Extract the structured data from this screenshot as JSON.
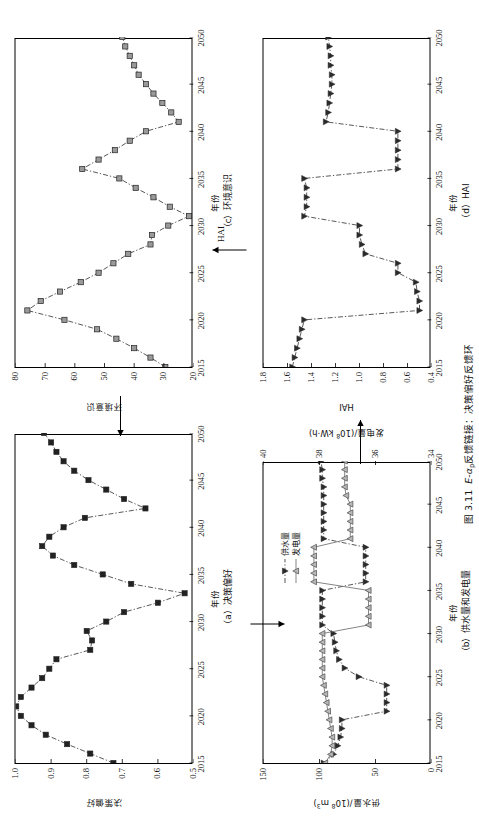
{
  "figure": {
    "caption_number": "图 3.11",
    "caption_text_pre": "E-α",
    "caption_text_sub": "p",
    "caption_text_post": "反馈链接：决策偏好反馈环"
  },
  "arrows": {
    "a_to_b_label": "",
    "b_to_d_label": "",
    "d_to_c_label": "HAI",
    "c_to_a_label": "",
    "supply_label_pre": "供水量/(10",
    "supply_label_sup": "8",
    "supply_label_post": " m",
    "supply_label_sup2": "3",
    "supply_label_end": ")"
  },
  "panels": [
    {
      "id": "a",
      "caption": "（a）决策偏好",
      "xlabel": "年份",
      "ylabel": "决策偏好",
      "xticks": [
        "2015",
        "2020",
        "2025",
        "2030",
        "2035",
        "2040",
        "2045",
        "2050"
      ],
      "yticks": [
        "0.5",
        "0.6",
        "0.7",
        "0.8",
        "0.9",
        "1.0"
      ]
    },
    {
      "id": "b",
      "caption": "（b）供水量和发电量",
      "xlabel": "年份",
      "ylabel_left_pre": "供水量/(10",
      "ylabel_left_sup": "8",
      "ylabel_left_mid": " m",
      "ylabel_left_sup2": "3",
      "ylabel_left_end": ")",
      "ylabel_right_pre": "发电量/(10",
      "ylabel_right_sup": "8",
      "ylabel_right_end": " kW·h)",
      "xticks": [
        "2015",
        "2020",
        "2025",
        "2030",
        "2035",
        "2040",
        "2045",
        "2050"
      ],
      "yticks_left": [
        "0",
        "50",
        "100",
        "150"
      ],
      "yticks_right": [
        "34",
        "36",
        "38",
        "40"
      ],
      "legend": [
        "供水量",
        "发电量"
      ]
    },
    {
      "id": "c",
      "caption": "（c）环境意识",
      "xlabel": "年份",
      "ylabel": "环境意识",
      "xticks": [
        "2015",
        "2020",
        "2025",
        "2030",
        "2035",
        "2040",
        "2045",
        "2050"
      ],
      "yticks": [
        "20",
        "30",
        "40",
        "50",
        "60",
        "70",
        "80"
      ]
    },
    {
      "id": "d",
      "caption": "（d）HAI",
      "xlabel": "年份",
      "ylabel": "HAI",
      "xticks": [
        "2015",
        "2020",
        "2025",
        "2030",
        "2035",
        "2040",
        "2045",
        "2050"
      ],
      "yticks": [
        "0.4",
        "0.6",
        "0.8",
        "1.0",
        "1.2",
        "1.4",
        "1.6",
        "1.8"
      ]
    }
  ],
  "chart_data": [
    {
      "type": "line",
      "panel": "a",
      "title": "（a）决策偏好",
      "xlabel": "年份",
      "ylabel": "决策偏好",
      "xlim": [
        2015,
        2050
      ],
      "ylim": [
        0.5,
        1.0
      ],
      "grid": false,
      "marker": "square-filled",
      "linestyle": "dash-dot",
      "x": [
        2015,
        2016,
        2017,
        2018,
        2019,
        2020,
        2021,
        2022,
        2023,
        2024,
        2025,
        2026,
        2027,
        2028,
        2029,
        2030,
        2031,
        2032,
        2033,
        2034,
        2035,
        2036,
        2037,
        2038,
        2039,
        2040,
        2041,
        2042,
        2043,
        2044,
        2045,
        2046,
        2047,
        2048,
        2049,
        2050
      ],
      "values": [
        0.725,
        0.79,
        0.855,
        0.915,
        0.955,
        0.985,
        0.998,
        0.985,
        0.955,
        0.925,
        0.905,
        0.885,
        0.79,
        0.785,
        0.8,
        0.745,
        0.695,
        0.6,
        0.525,
        0.675,
        0.755,
        0.835,
        0.895,
        0.925,
        0.905,
        0.865,
        0.805,
        0.635,
        0.695,
        0.745,
        0.795,
        0.835,
        0.865,
        0.885,
        0.9,
        0.92
      ]
    },
    {
      "type": "line",
      "panel": "b",
      "title": "（b）供水量和发电量",
      "xlabel": "年份",
      "ylabel_left": "供水量/(10^8 m^3)",
      "ylabel_right": "发电量/(10^8 kW·h)",
      "xlim": [
        2015,
        2050
      ],
      "ylim_left": [
        0,
        150
      ],
      "ylim_right": [
        34,
        40
      ],
      "grid": false,
      "series": [
        {
          "name": "供水量",
          "axis": "right",
          "marker": "triangle-down-filled",
          "linestyle": "dash-dot",
          "x": [
            2015,
            2016,
            2017,
            2018,
            2019,
            2020,
            2021,
            2022,
            2023,
            2024,
            2025,
            2026,
            2027,
            2028,
            2029,
            2030,
            2031,
            2032,
            2033,
            2034,
            2035,
            2036,
            2037,
            2038,
            2039,
            2040,
            2041,
            2042,
            2043,
            2044,
            2045,
            2046,
            2047,
            2048,
            2049,
            2050
          ],
          "values": [
            37.85,
            37.5,
            37.35,
            37.25,
            37.2,
            37.2,
            35.6,
            35.6,
            35.6,
            35.6,
            36.6,
            37.1,
            37.3,
            37.4,
            37.45,
            37.5,
            37.9,
            37.9,
            37.9,
            37.9,
            37.9,
            36.35,
            36.35,
            36.35,
            36.35,
            36.35,
            37.85,
            37.85,
            37.85,
            37.85,
            37.85,
            37.85,
            37.85,
            37.9,
            37.9,
            37.95
          ]
        },
        {
          "name": "发电量",
          "axis": "right",
          "marker": "triangle-up-open",
          "linestyle": "solid",
          "x": [
            2015,
            2016,
            2017,
            2018,
            2019,
            2020,
            2021,
            2022,
            2023,
            2024,
            2025,
            2026,
            2027,
            2028,
            2029,
            2030,
            2031,
            2032,
            2033,
            2034,
            2035,
            2036,
            2037,
            2038,
            2039,
            2040,
            2041,
            2042,
            2043,
            2044,
            2045,
            2046,
            2047,
            2048,
            2049,
            2050
          ],
          "values": [
            37.8,
            37.6,
            37.55,
            37.55,
            37.6,
            37.65,
            37.7,
            37.75,
            37.8,
            37.85,
            37.9,
            37.9,
            37.9,
            37.9,
            37.9,
            37.9,
            36.25,
            36.25,
            36.25,
            36.25,
            36.25,
            38.2,
            38.2,
            38.2,
            38.2,
            38.2,
            36.9,
            36.9,
            36.9,
            36.9,
            36.9,
            37.05,
            37.1,
            37.1,
            37.1,
            37.1
          ]
        }
      ]
    },
    {
      "type": "line",
      "panel": "c",
      "title": "（c）环境意识",
      "xlabel": "年份",
      "ylabel": "环境意识",
      "xlim": [
        2015,
        2050
      ],
      "ylim": [
        20,
        80
      ],
      "grid": false,
      "marker": "square-open",
      "linestyle": "dash-dot",
      "x": [
        2015,
        2016,
        2017,
        2018,
        2019,
        2020,
        2021,
        2022,
        2023,
        2024,
        2025,
        2026,
        2027,
        2028,
        2029,
        2030,
        2031,
        2032,
        2033,
        2034,
        2035,
        2036,
        2037,
        2038,
        2039,
        2040,
        2041,
        2042,
        2043,
        2044,
        2045,
        2046,
        2047,
        2048,
        2049,
        2050
      ],
      "values": [
        29.5,
        34.5,
        40.0,
        46.0,
        52.5,
        63.5,
        76.0,
        71.5,
        65.0,
        58.0,
        52.0,
        47.0,
        42.0,
        34.5,
        34.0,
        28.5,
        21.5,
        28.0,
        33.5,
        39.5,
        45.0,
        57.5,
        52.0,
        46.5,
        41.5,
        36.0,
        25.0,
        27.5,
        30.5,
        33.5,
        36.0,
        38.5,
        40.0,
        41.5,
        43.0,
        44.0
      ]
    },
    {
      "type": "line",
      "panel": "d",
      "title": "（d）HAI",
      "xlabel": "年份",
      "ylabel": "HAI",
      "xlim": [
        2015,
        2050
      ],
      "ylim": [
        0.4,
        1.8
      ],
      "grid": false,
      "marker": "triangle-down-filled",
      "linestyle": "dash-dot",
      "x": [
        2015,
        2016,
        2017,
        2018,
        2019,
        2020,
        2021,
        2022,
        2023,
        2024,
        2025,
        2026,
        2027,
        2028,
        2029,
        2030,
        2031,
        2032,
        2033,
        2034,
        2035,
        2036,
        2037,
        2038,
        2039,
        2040,
        2041,
        2042,
        2043,
        2044,
        2045,
        2046,
        2047,
        2048,
        2049,
        2050
      ],
      "values": [
        1.56,
        1.54,
        1.52,
        1.5,
        1.48,
        1.46,
        0.5,
        0.5,
        0.52,
        0.53,
        0.68,
        0.68,
        0.95,
        0.98,
        1.0,
        1.0,
        1.46,
        1.44,
        1.44,
        1.44,
        1.46,
        0.68,
        0.68,
        0.68,
        0.68,
        0.68,
        1.28,
        1.26,
        1.25,
        1.24,
        1.23,
        1.23,
        1.24,
        1.24,
        1.25,
        1.26
      ]
    }
  ]
}
